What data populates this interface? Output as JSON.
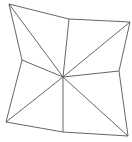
{
  "diagram": {
    "stroke_color": "#555555",
    "stroke_width": 0.9,
    "background": "#ffffff",
    "center": {
      "id": "C",
      "x": 63,
      "y": 77
    },
    "vertices": [
      {
        "id": "TL",
        "x": 9,
        "y": 4
      },
      {
        "id": "TM",
        "x": 69,
        "y": 19
      },
      {
        "id": "TR",
        "x": 130,
        "y": 22
      },
      {
        "id": "RM",
        "x": 119,
        "y": 71
      },
      {
        "id": "BR",
        "x": 128,
        "y": 136
      },
      {
        "id": "BM",
        "x": 63,
        "y": 132
      },
      {
        "id": "BL",
        "x": 6,
        "y": 122
      },
      {
        "id": "LM",
        "x": 22,
        "y": 60
      }
    ],
    "outline_order": [
      "TL",
      "TM",
      "TR",
      "RM",
      "BR",
      "BM",
      "BL",
      "LM"
    ],
    "spokes": [
      "TL",
      "TM",
      "TR",
      "RM",
      "BR",
      "BM",
      "BL",
      "LM"
    ]
  }
}
